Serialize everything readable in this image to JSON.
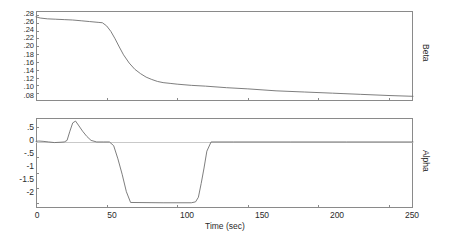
{
  "figure": {
    "background": "#ffffff",
    "line_color": "#6f6f6f",
    "axis_color": "#8a8a8a",
    "text_color": "#2b2b2b"
  },
  "axis_titles": {
    "x": "Time (sec)",
    "y_top": "Beta",
    "y_bottom": "Alpha"
  },
  "x_ticks": [
    "0",
    "50",
    "100",
    "150",
    "200",
    "250"
  ],
  "y_ticks_top": [
    ".28",
    ".26",
    ".24",
    ".22",
    ".20",
    ".18",
    ".16",
    ".14",
    ".12",
    ".10",
    ".08"
  ],
  "y_ticks_bottom": [
    ".5",
    "0",
    "-.5",
    "-1",
    "-1.5",
    "-2"
  ],
  "chart_data": [
    {
      "type": "line",
      "title": "",
      "xlabel": "Time (sec)",
      "ylabel": "Beta",
      "xlim": [
        0,
        267
      ],
      "ylim": [
        0.06,
        0.29
      ],
      "xticks": [
        0,
        50,
        100,
        150,
        200,
        250
      ],
      "yticks": [
        0.08,
        0.1,
        0.12,
        0.14,
        0.16,
        0.18,
        0.2,
        0.22,
        0.24,
        0.26,
        0.28
      ],
      "grid": false,
      "legend": "none",
      "series": [
        {
          "name": "Beta",
          "x": [
            0,
            3,
            8,
            14,
            20,
            26,
            32,
            38,
            44,
            47,
            50,
            53,
            56,
            59,
            62,
            66,
            70,
            74,
            78,
            82,
            86,
            90,
            95,
            100,
            110,
            120,
            135,
            150,
            170,
            190,
            210,
            230,
            250,
            267
          ],
          "y": [
            0.275,
            0.272,
            0.27,
            0.269,
            0.268,
            0.267,
            0.265,
            0.263,
            0.261,
            0.26,
            0.252,
            0.238,
            0.219,
            0.198,
            0.178,
            0.157,
            0.141,
            0.13,
            0.121,
            0.115,
            0.11,
            0.107,
            0.105,
            0.103,
            0.1,
            0.098,
            0.094,
            0.091,
            0.086,
            0.083,
            0.08,
            0.077,
            0.074,
            0.072
          ]
        }
      ]
    },
    {
      "type": "line",
      "title": "",
      "xlabel": "Time (sec)",
      "ylabel": "Alpha",
      "xlim": [
        0,
        267
      ],
      "ylim": [
        -2.15,
        0.78
      ],
      "xticks": [
        0,
        50,
        100,
        150,
        200,
        250
      ],
      "yticks": [
        0.5,
        0,
        -0.5,
        -1,
        -1.5,
        -2
      ],
      "grid": false,
      "legend": "none",
      "series": [
        {
          "name": "Alpha",
          "x": [
            0,
            2,
            5,
            9,
            13,
            17,
            20,
            22,
            24,
            26,
            28,
            30,
            33,
            36,
            39,
            43,
            48,
            52,
            55,
            58,
            61,
            64,
            67,
            90,
            110,
            113,
            115,
            117,
            119,
            121,
            124,
            140,
            180,
            220,
            267
          ],
          "y": [
            0.02,
            0.03,
            0.02,
            0.0,
            -0.02,
            -0.01,
            0.0,
            0.05,
            0.35,
            0.62,
            0.68,
            0.55,
            0.35,
            0.18,
            0.05,
            0.0,
            0.0,
            0.0,
            -0.12,
            -0.55,
            -1.05,
            -1.62,
            -1.97,
            -1.98,
            -1.98,
            -1.95,
            -1.8,
            -1.35,
            -0.85,
            -0.3,
            0.0,
            0.0,
            0.0,
            0.0,
            0.0
          ]
        }
      ]
    }
  ]
}
